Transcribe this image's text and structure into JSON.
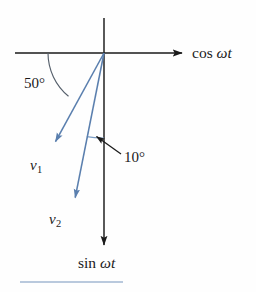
{
  "figure": {
    "type": "phasor-vector-diagram",
    "background_color": "#fefefe",
    "axis_color": "#1a1a1a",
    "vector_color": "#5a7fae",
    "arc_color_50": "#555f6b",
    "arc_color_10": "#7a9cc4",
    "leader_color": "#1a1a1a",
    "footer_rule_color": "#b9c9dd",
    "origin": {
      "x": 104,
      "y": 53
    }
  },
  "axes": {
    "horizontal": {
      "label": "cos ωt",
      "label_text": "cos",
      "label_symbol": "ωt",
      "from": {
        "x": 15,
        "y": 53
      },
      "to": {
        "x": 185,
        "y": 53
      },
      "arrow": "right"
    },
    "vertical": {
      "label": "sin ωt",
      "label_text": "sin",
      "label_symbol": "ωt",
      "from": {
        "x": 104,
        "y": 18
      },
      "to": {
        "x": 104,
        "y": 248
      },
      "arrow": "down"
    }
  },
  "vectors": [
    {
      "name": "v1",
      "label": "v",
      "subscript": "1",
      "from": {
        "x": 104,
        "y": 53
      },
      "to": {
        "x": 52,
        "y": 148
      },
      "angle_from_negative_x_axis_deg": 50,
      "color": "#5a7fae"
    },
    {
      "name": "v2",
      "label": "v",
      "subscript": "2",
      "from": {
        "x": 104,
        "y": 53
      },
      "to": {
        "x": 73,
        "y": 205
      },
      "angle_from_vertical_axis_deg": 10,
      "color": "#5a7fae"
    }
  ],
  "angles": [
    {
      "name": "angle-50",
      "label": "50°",
      "value": 50,
      "unit": "degrees",
      "between": [
        "negative-x-axis",
        "v1"
      ],
      "arc_radius": 56,
      "label_position": {
        "x": 24,
        "y": 76
      }
    },
    {
      "name": "angle-10",
      "label": "10°",
      "value": 10,
      "unit": "degrees",
      "between": [
        "v2",
        "vertical-axis"
      ],
      "arc_radius": 85,
      "label_position": {
        "x": 124,
        "y": 150
      },
      "leader_from": {
        "x": 154,
        "y": 163
      },
      "leader_to": {
        "x": 92,
        "y": 133
      }
    }
  ],
  "footer": {
    "rule_visible": true,
    "rule_from_x": 20,
    "rule_to_x": 123,
    "rule_y": 281
  }
}
